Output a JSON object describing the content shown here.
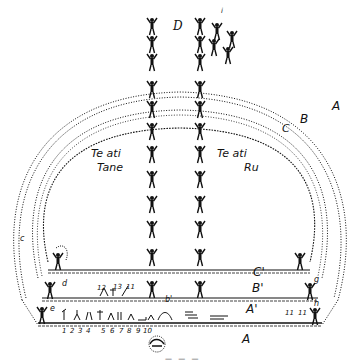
{
  "diagram": {
    "type": "cosmological-illustration",
    "style": "black-and-white line drawing",
    "labels": {
      "top": "D",
      "top_right_small": "i",
      "arc_outer": "A",
      "arc_middle": "B",
      "arc_inner": "C",
      "platform_c": "C'",
      "platform_b": "B'",
      "platform_a": "A'",
      "ground": "A",
      "left_column_title_line1": "Te ati",
      "left_column_title_line2": "Tane",
      "right_column_title_line1": "Te ati",
      "right_column_title_line2": "Ru",
      "left_upper_marker": "c",
      "left_mid_marker": "d",
      "left_lower_marker": "e",
      "center_lower_marker": "b'",
      "right_marker_g": "g",
      "right_marker_h": "h",
      "right_marker_11a": "11",
      "right_marker_11b": "11",
      "upper_numbers": [
        "12",
        "13",
        "11"
      ],
      "bottom_numbers": [
        "1",
        "2",
        "3",
        "4",
        "5",
        "6",
        "7",
        "8",
        "9",
        "10"
      ],
      "caption": "— — —"
    },
    "figures": {
      "left_column_count": 12,
      "right_column_count": 12
    },
    "colors": {
      "ink": "#111111",
      "paper": "#ffffff"
    }
  }
}
